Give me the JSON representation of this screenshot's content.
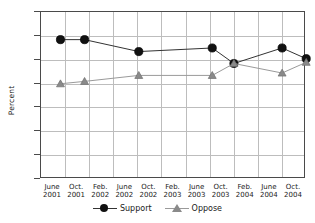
{
  "chart_data": {
    "type": "line",
    "title": "",
    "xlabel": "",
    "ylabel": "Percent",
    "ylim": [
      0,
      70
    ],
    "ytick_step": 10,
    "grid": true,
    "legend_position": "bottom",
    "categories": [
      "June 2001",
      "Oct. 2001",
      "Feb. 2002",
      "June 2002",
      "Oct. 2002",
      "Feb. 2003",
      "June 2003",
      "Oct. 2003",
      "Feb. 2004",
      "June 2004",
      "Oct. 2004"
    ],
    "yticks": [
      "0",
      "10",
      "20",
      "30",
      "40",
      "50",
      "60",
      "70"
    ],
    "xticklabels": [
      {
        "line1": "June",
        "line2": "2001"
      },
      {
        "line1": "Oct.",
        "line2": "2001"
      },
      {
        "line1": "Feb.",
        "line2": "2002"
      },
      {
        "line1": "June",
        "line2": "2002"
      },
      {
        "line1": "Oct.",
        "line2": "2002"
      },
      {
        "line1": "Feb.",
        "line2": "2003"
      },
      {
        "line1": "June",
        "line2": "2003"
      },
      {
        "line1": "Oct.",
        "line2": "2003"
      },
      {
        "line1": "Feb.",
        "line2": "2004"
      },
      {
        "line1": "June",
        "line2": "2004"
      },
      {
        "line1": "Oct.",
        "line2": "2004"
      }
    ],
    "series": [
      {
        "name": "Support",
        "color": "#111111",
        "marker": "circle",
        "points": [
          {
            "x": 0.35,
            "label": "June 2001",
            "value": 58
          },
          {
            "x": 1.35,
            "label": "Oct. 2001 / Feb. 2002",
            "value": 58
          },
          {
            "x": 3.6,
            "label": "Oct. 2002",
            "value": 53
          },
          {
            "x": 6.65,
            "label": "Oct. 2003",
            "value": 54.5
          },
          {
            "x": 7.55,
            "label": "Feb. 2004",
            "value": 48
          },
          {
            "x": 9.55,
            "label": "Oct. 2004",
            "value": 54.5
          },
          {
            "x": 10.55,
            "label": "Late 2004",
            "value": 50
          }
        ]
      },
      {
        "name": "Oppose",
        "color": "#8a8a8a",
        "marker": "triangle",
        "points": [
          {
            "x": 0.35,
            "label": "June 2001",
            "value": 39.5
          },
          {
            "x": 1.35,
            "label": "Oct. 2001 / Feb. 2002",
            "value": 40.5
          },
          {
            "x": 3.6,
            "label": "Oct. 2002",
            "value": 43
          },
          {
            "x": 6.65,
            "label": "Oct. 2003",
            "value": 43
          },
          {
            "x": 7.55,
            "label": "Feb. 2004",
            "value": 48
          },
          {
            "x": 9.55,
            "label": "Oct. 2004",
            "value": 44
          },
          {
            "x": 10.55,
            "label": "Late 2004",
            "value": 48.5
          }
        ]
      }
    ],
    "legend": [
      {
        "label": "Support",
        "marker": "circle",
        "color": "#111111"
      },
      {
        "label": "Oppose",
        "marker": "triangle",
        "color": "#8a8a8a"
      }
    ]
  }
}
